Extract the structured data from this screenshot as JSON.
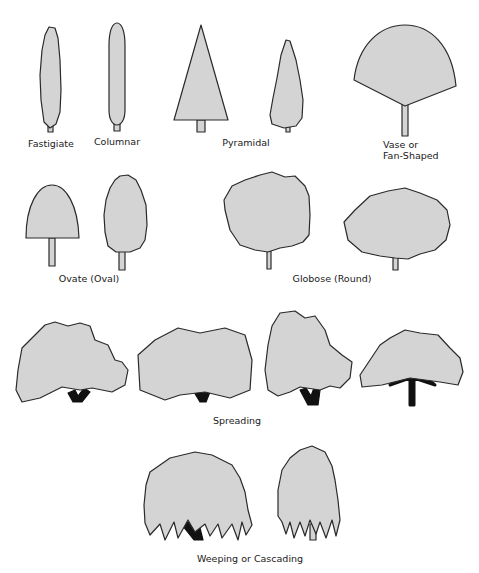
{
  "figure": {
    "colors": {
      "crown_fill": "#d4d4d4",
      "outline": "#2a2a2a",
      "trunk_fill": "#d4d4d4",
      "branch_fill": "#111111",
      "background": "#ffffff"
    }
  },
  "groups": [
    {
      "id": "fastigiate",
      "label": "Fastigiate"
    },
    {
      "id": "columnar",
      "label": "Columnar"
    },
    {
      "id": "pyramidal",
      "label": "Pyramidal"
    },
    {
      "id": "vase",
      "label_line1": "Vase or",
      "label_line2": "Fan-Shaped"
    },
    {
      "id": "ovate",
      "label": "Ovate (Oval)"
    },
    {
      "id": "globose",
      "label": "Globose (Round)"
    },
    {
      "id": "spreading",
      "label": "Spreading"
    },
    {
      "id": "weeping",
      "label": "Weeping or Cascading"
    }
  ]
}
